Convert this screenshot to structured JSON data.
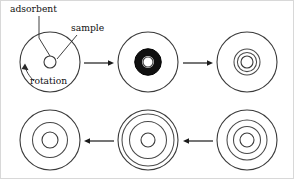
{
  "figure": {
    "canvas": {
      "width": 294,
      "height": 179,
      "background": "#ffffff"
    },
    "colors": {
      "outline": "#3a3a3a",
      "ring": "#4a4a4a",
      "band": "#101010",
      "arrow": "#1a1a1a",
      "leader": "#2a2a2a",
      "frame": "#d8d8d8",
      "text": "#101010"
    },
    "labels": {
      "adsorbent": "adsorbent",
      "sample": "sample",
      "rotation": "rotation"
    },
    "stages": [
      {
        "id": "stage-1",
        "name": "disc-initial-sample-spot",
        "cx": 50,
        "cy": 62,
        "r": 30,
        "rings": [],
        "sample_hole_r": 6,
        "black_band": null
      },
      {
        "id": "stage-2",
        "name": "disc-dark-adsorbed-band",
        "cx": 148,
        "cy": 62,
        "r": 30,
        "rings": [],
        "sample_hole_r": 5,
        "black_band": {
          "r": 9.6,
          "width": 7.2
        }
      },
      {
        "id": "stage-3",
        "name": "disc-three-narrow-rings",
        "cx": 247,
        "cy": 62,
        "r": 30,
        "rings": [
          13,
          9.6
        ],
        "sample_hole_r": 6,
        "black_band": null
      },
      {
        "id": "stage-4",
        "name": "disc-rings-spreading",
        "cx": 247,
        "cy": 140,
        "r": 30,
        "rings": [
          20,
          13.5
        ],
        "sample_hole_r": 7,
        "black_band": null
      },
      {
        "id": "stage-5",
        "name": "disc-rings-near-edge",
        "cx": 148,
        "cy": 140,
        "r": 30,
        "rings": [
          26,
          18.5
        ],
        "sample_hole_r": 7,
        "black_band": null
      },
      {
        "id": "stage-6",
        "name": "disc-final-two-rings",
        "cx": 50,
        "cy": 140,
        "r": 30,
        "rings": [
          17.5
        ],
        "sample_hole_r": 8,
        "black_band": null
      }
    ],
    "arrows": [
      {
        "id": "arrow-1",
        "name": "arrow-stage1-to-stage2",
        "direction": "right",
        "x1": 84,
        "x2": 114,
        "y": 63
      },
      {
        "id": "arrow-2",
        "name": "arrow-stage2-to-stage3",
        "direction": "right",
        "x1": 183,
        "x2": 213,
        "y": 63
      },
      {
        "id": "arrow-3",
        "name": "arrow-stage4-to-stage5",
        "direction": "left",
        "x1": 213,
        "x2": 183,
        "y": 141
      },
      {
        "id": "arrow-4",
        "name": "arrow-stage5-to-stage6",
        "direction": "left",
        "x1": 114,
        "x2": 84,
        "y": 141
      }
    ],
    "label_positions": {
      "adsorbent": {
        "x": 10,
        "y": 12
      },
      "sample": {
        "x": 71,
        "y": 31
      },
      "rotation": {
        "x": 30,
        "y": 83
      }
    }
  }
}
